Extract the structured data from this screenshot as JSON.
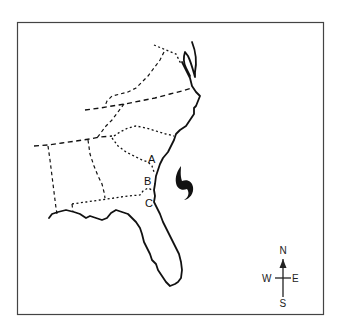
{
  "map": {
    "type": "outline map",
    "region": "Southeastern United States coast",
    "frame": {
      "border_color": "#444444",
      "background": "#ffffff"
    },
    "locations": [
      {
        "id": "A",
        "label": "A"
      },
      {
        "id": "B",
        "label": "B"
      },
      {
        "id": "C",
        "label": "C"
      }
    ],
    "symbols": [
      {
        "name": "hurricane-symbol",
        "description": "hurricane symbol offshore in the Atlantic"
      }
    ],
    "compass": {
      "north": "N",
      "south": "S",
      "east": "E",
      "west": "W"
    }
  }
}
